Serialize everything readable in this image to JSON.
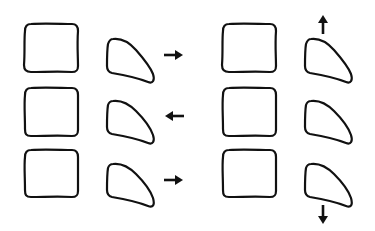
{
  "diagram": {
    "type": "schematic",
    "colors": {
      "stroke": "#111111",
      "background": "#ffffff"
    },
    "columns": [
      {
        "name": "left",
        "rows": [
          {
            "block": "square",
            "piece": "wedge",
            "arrow": "right-arrow-icon",
            "arrow_direction": "right"
          },
          {
            "block": "square",
            "piece": "wedge",
            "arrow": "left-arrow-icon",
            "arrow_direction": "left"
          },
          {
            "block": "square",
            "piece": "wedge",
            "arrow": "right-arrow-icon",
            "arrow_direction": "right"
          }
        ]
      },
      {
        "name": "right",
        "rows": [
          {
            "block": "square",
            "piece": "wedge",
            "arrow": "up-arrow-icon",
            "arrow_direction": "up"
          },
          {
            "block": "square",
            "piece": "wedge",
            "arrow": null,
            "arrow_direction": null
          },
          {
            "block": "square",
            "piece": "wedge",
            "arrow": "down-arrow-icon",
            "arrow_direction": "down"
          }
        ]
      }
    ]
  }
}
